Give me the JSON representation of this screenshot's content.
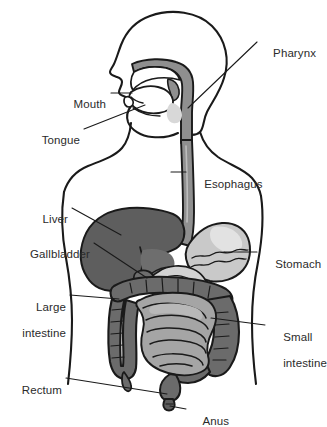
{
  "figure": {
    "type": "anatomical-diagram",
    "background_color": "#ffffff",
    "outline_color": "#1a1a1a"
  },
  "labels": [
    {
      "id": "pharynx",
      "text": "Pharynx",
      "text2": ""
    },
    {
      "id": "mouth",
      "text": "Mouth",
      "text2": ""
    },
    {
      "id": "tongue",
      "text": "Tongue",
      "text2": ""
    },
    {
      "id": "esophagus",
      "text": "Esophagus",
      "text2": ""
    },
    {
      "id": "liver",
      "text": "Liver",
      "text2": ""
    },
    {
      "id": "gallbladder",
      "text": "Gallbladder",
      "text2": ""
    },
    {
      "id": "stomach",
      "text": "Stomach",
      "text2": ""
    },
    {
      "id": "large-intestine",
      "text": "Large",
      "text2": "intestine"
    },
    {
      "id": "small-intestine",
      "text": "Small",
      "text2": "intestine"
    },
    {
      "id": "rectum",
      "text": "Rectum",
      "text2": ""
    },
    {
      "id": "anus",
      "text": "Anus",
      "text2": ""
    }
  ],
  "organs": {
    "body_outline": {
      "name": "Body outline",
      "fill": "#ffffff",
      "stroke": "#1a1a1a"
    },
    "oral_pharynx": {
      "name": "Mouth and pharynx",
      "fill": "#8f8f8f",
      "stroke": "#1a1a1a"
    },
    "tongue": {
      "name": "Tongue",
      "fill": "#ffffff",
      "stroke": "#1a1a1a"
    },
    "esophagus": {
      "name": "Esophagus",
      "fill": "#8f8f8f",
      "stroke": "#1a1a1a"
    },
    "liver": {
      "name": "Liver",
      "fill": "#5e5e5e",
      "stroke": "#1a1a1a"
    },
    "gallbladder": {
      "name": "Gallbladder",
      "fill": "#6e6e6e",
      "stroke": "#1a1a1a"
    },
    "stomach": {
      "name": "Stomach",
      "fill": "#c9c9c9",
      "stroke": "#1a1a1a"
    },
    "large_intestine": {
      "name": "Large intestine",
      "fill": "#6b6b6b",
      "stroke": "#1a1a1a"
    },
    "small_intestine": {
      "name": "Small intestine",
      "fill": "#a5a5a5",
      "stroke": "#1a1a1a"
    },
    "rectum": {
      "name": "Rectum",
      "fill": "#6b6b6b",
      "stroke": "#1a1a1a"
    },
    "anus": {
      "name": "Anus",
      "fill": "#5e5e5e",
      "stroke": "#1a1a1a"
    }
  }
}
